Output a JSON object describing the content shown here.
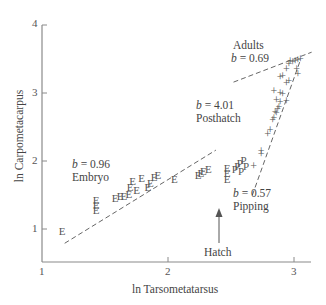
{
  "chart_data": {
    "type": "scatter",
    "title": "",
    "xlabel": "ln Tarsometatarsus",
    "ylabel": "ln Carpometacarpus",
    "xlim": [
      1,
      3.13
    ],
    "ylim": [
      0.5,
      4
    ],
    "xticks": [
      "1",
      "2",
      "3"
    ],
    "yticks": [
      "1",
      "2",
      "3",
      "4"
    ],
    "grid": false,
    "legend": "none",
    "series": [
      {
        "name": "Embryo",
        "marker": "E",
        "points": [
          [
            1.16,
            0.97
          ],
          [
            1.43,
            1.28
          ],
          [
            1.43,
            1.36
          ],
          [
            1.43,
            1.43
          ],
          [
            1.58,
            1.46
          ],
          [
            1.62,
            1.48
          ],
          [
            1.65,
            1.49
          ],
          [
            1.69,
            1.52
          ],
          [
            1.7,
            1.62
          ],
          [
            1.72,
            1.7
          ],
          [
            1.75,
            1.58
          ],
          [
            1.79,
            1.75
          ],
          [
            1.84,
            1.62
          ],
          [
            1.86,
            1.68
          ],
          [
            1.89,
            1.77
          ],
          [
            1.92,
            1.8
          ],
          [
            2.05,
            1.74
          ],
          [
            2.24,
            1.79
          ],
          [
            2.26,
            1.82
          ],
          [
            2.28,
            1.86
          ],
          [
            2.32,
            1.88
          ],
          [
            2.47,
            1.74
          ],
          [
            2.47,
            1.82
          ],
          [
            2.47,
            1.9
          ]
        ]
      },
      {
        "name": "Pipping",
        "marker": "P",
        "points": [
          [
            2.53,
            1.88
          ],
          [
            2.55,
            1.92
          ],
          [
            2.57,
            1.97
          ],
          [
            2.58,
            1.85
          ],
          [
            2.6,
            2.02
          ],
          [
            2.62,
            1.93
          ]
        ]
      },
      {
        "name": "Posthatch / Adults",
        "marker": "+",
        "points": [
          [
            2.68,
            1.92
          ],
          [
            2.74,
            2.11
          ],
          [
            2.74,
            2.14
          ],
          [
            2.79,
            2.4
          ],
          [
            2.81,
            2.45
          ],
          [
            2.83,
            2.6
          ],
          [
            2.84,
            2.63
          ],
          [
            2.85,
            2.72
          ],
          [
            2.86,
            2.7
          ],
          [
            2.87,
            2.77
          ],
          [
            2.88,
            2.8
          ],
          [
            2.86,
            2.9
          ],
          [
            2.89,
            2.87
          ],
          [
            2.84,
            3.03
          ],
          [
            2.89,
            3.0
          ],
          [
            2.91,
            2.98
          ],
          [
            2.94,
            2.88
          ],
          [
            2.94,
            3.15
          ],
          [
            2.89,
            3.23
          ],
          [
            2.91,
            3.25
          ],
          [
            2.94,
            3.36
          ],
          [
            2.96,
            3.42
          ],
          [
            2.97,
            3.47
          ],
          [
            2.99,
            3.45
          ],
          [
            3.01,
            3.47
          ],
          [
            3.03,
            3.48
          ],
          [
            3.05,
            3.5
          ],
          [
            3.02,
            3.36
          ],
          [
            3.03,
            3.28
          ],
          [
            2.96,
            3.18
          ]
        ]
      }
    ],
    "fit_lines": [
      {
        "name": "Embryo",
        "slope_label": "b = 0.96",
        "from": [
          1.18,
          0.79
        ],
        "to": [
          2.38,
          2.16
        ]
      },
      {
        "name": "Posthatch",
        "slope_label": "b = 4.01",
        "from": [
          2.67,
          1.5
        ],
        "to": [
          3.05,
          3.48
        ]
      },
      {
        "name": "Adults",
        "slope_label": "b = 0.69",
        "from": [
          2.52,
          3.16
        ],
        "to": [
          3.14,
          3.6
        ]
      }
    ],
    "annotations": [
      {
        "text": "Adults",
        "sub": "b = 0.69"
      },
      {
        "text": "Posthatch",
        "sub": "b = 4.01"
      },
      {
        "text": "Embryo",
        "sub": "b = 0.96"
      },
      {
        "text": "Pipping",
        "sub": "b = 0.57"
      },
      {
        "text": "Hatch",
        "arrow": "up",
        "x": 2.47
      }
    ]
  },
  "labels": {
    "xlabel": "ln Tarsometatarsus",
    "ylabel": "ln Carpometacarpus",
    "x_ticks": [
      "1",
      "2",
      "3"
    ],
    "y_ticks": [
      "4",
      "3",
      "2",
      "1"
    ],
    "adults": "Adults",
    "adults_b_var": "b",
    "adults_b_val": " = 0.69",
    "posthatch_b_var": "b",
    "posthatch_b_val": " = 4.01",
    "posthatch": "Posthatch",
    "embryo_b_var": "b",
    "embryo_b_val": " = 0.96",
    "embryo": "Embryo",
    "pipping_b_var": "b",
    "pipping_b_val": " = 0.57",
    "pipping": "Pipping",
    "hatch": "Hatch"
  },
  "colors": {
    "axis": "#8a8a8a",
    "marker": "#555555",
    "fit_line": "#555555",
    "text": "#444444"
  }
}
